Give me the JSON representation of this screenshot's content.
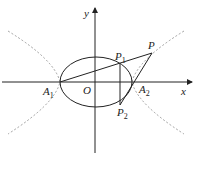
{
  "diagram": {
    "axes": {
      "x_label": "x",
      "y_label": "y",
      "origin_label": "O"
    },
    "points": {
      "A1": {
        "name": "A",
        "sub": "1"
      },
      "A2": {
        "name": "A",
        "sub": "2"
      },
      "P": {
        "name": "P"
      },
      "P1": {
        "name": "P",
        "sub": "1"
      },
      "P2": {
        "name": "P",
        "sub": "2"
      }
    },
    "curves": [
      "ellipse (solid)",
      "hyperbola (dashed)"
    ],
    "colors": {
      "line": "#222222",
      "dashed": "#888888"
    }
  }
}
